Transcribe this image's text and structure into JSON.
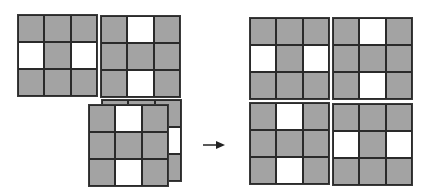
{
  "diagram": {
    "colors": {
      "filled": "#a3a3a3",
      "empty": "#ffffff",
      "border": "#2a2a2a"
    },
    "left_group": [
      {
        "id": "A",
        "x": 17,
        "y": 14,
        "cells": [
          "g",
          "g",
          "g",
          "w",
          "g",
          "w",
          "g",
          "g",
          "g"
        ]
      },
      {
        "id": "B",
        "x": 100,
        "y": 15,
        "cells": [
          "g",
          "w",
          "g",
          "g",
          "g",
          "g",
          "g",
          "w",
          "g"
        ]
      },
      {
        "id": "C-back",
        "x": 101,
        "y": 99,
        "cells": [
          "g",
          "g",
          "g",
          "g",
          "g",
          "w",
          "g",
          "g",
          "g"
        ]
      },
      {
        "id": "C",
        "x": 88,
        "y": 104,
        "cells": [
          "g",
          "w",
          "g",
          "g",
          "g",
          "g",
          "g",
          "w",
          "g"
        ]
      }
    ],
    "arrow": {
      "direction": "right",
      "icon": "arrow-right-icon"
    },
    "right_group": [
      {
        "id": "D",
        "x": 249,
        "y": 17,
        "cells": [
          "g",
          "g",
          "g",
          "w",
          "g",
          "w",
          "g",
          "g",
          "g"
        ]
      },
      {
        "id": "E",
        "x": 332,
        "y": 17,
        "cells": [
          "g",
          "w",
          "g",
          "g",
          "g",
          "g",
          "g",
          "w",
          "g"
        ]
      },
      {
        "id": "F",
        "x": 249,
        "y": 102,
        "cells": [
          "g",
          "w",
          "g",
          "g",
          "g",
          "g",
          "g",
          "w",
          "g"
        ]
      },
      {
        "id": "G",
        "x": 332,
        "y": 103,
        "cells": [
          "g",
          "g",
          "g",
          "w",
          "g",
          "w",
          "g",
          "g",
          "g"
        ]
      }
    ]
  }
}
